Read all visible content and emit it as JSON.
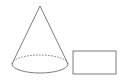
{
  "diagram": {
    "type": "geometry",
    "stroke_color": "#6e6e6e",
    "background": "#ffffff",
    "shapes": [
      {
        "name": "cone",
        "apex": [
          40,
          6
        ],
        "base_center": [
          40,
          64
        ],
        "base_rx": 28,
        "base_ry": 9,
        "back_edge_style": "dashed",
        "front_edge_style": "solid"
      },
      {
        "name": "rectangle",
        "x": 73,
        "y": 51,
        "width": 43,
        "height": 23
      }
    ]
  }
}
